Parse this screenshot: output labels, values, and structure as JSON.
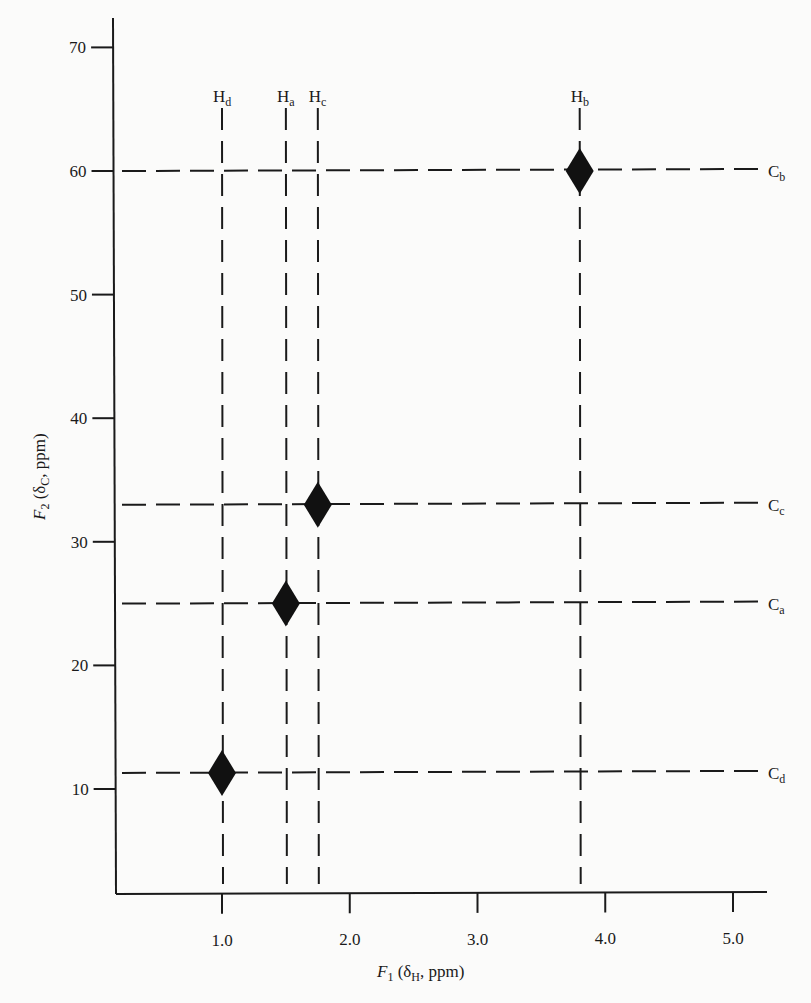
{
  "chart_data": {
    "type": "scatter",
    "title": "",
    "subtitle": "2D HETCOR correlation map",
    "xlabel": "F1 (δH, ppm)",
    "ylabel": "F2 (δC, ppm)",
    "xlabel_parts": {
      "main": "F",
      "sub": "1",
      "rest_open": " (δ",
      "rest_sub": "H",
      "rest_close": ", ppm)"
    },
    "ylabel_parts": {
      "main": "F",
      "sub": "2",
      "rest_open": " (δ",
      "rest_sub": "C",
      "rest_close": ", ppm)"
    },
    "xlim": [
      0.25,
      5.25
    ],
    "ylim": [
      3,
      73
    ],
    "x_ticks": [
      1.0,
      2.0,
      3.0,
      4.0,
      5.0
    ],
    "x_tick_labels": [
      "1.0",
      "2.0",
      "3.0",
      "4.0",
      "5.0"
    ],
    "y_ticks": [
      10,
      20,
      30,
      40,
      50,
      60,
      70
    ],
    "y_tick_labels": [
      "10",
      "20",
      "30",
      "40",
      "50",
      "60",
      "70"
    ],
    "grid": false,
    "legend": "none",
    "marker": "filled-diamond",
    "marker_color": "#111111",
    "guide_line_style": "dashed",
    "points": [
      {
        "h_label": "H",
        "h_sub": "d",
        "c_label": "C",
        "c_sub": "d",
        "x": 1.0,
        "y": 11.3
      },
      {
        "h_label": "H",
        "h_sub": "a",
        "c_label": "C",
        "c_sub": "a",
        "x": 1.5,
        "y": 25.0
      },
      {
        "h_label": "H",
        "h_sub": "c",
        "c_label": "C",
        "c_sub": "c",
        "x": 1.75,
        "y": 33.0
      },
      {
        "h_label": "H",
        "h_sub": "b",
        "c_label": "C",
        "c_sub": "b",
        "x": 3.8,
        "y": 60.0
      }
    ]
  },
  "colors": {
    "background": "#fbfbfa",
    "ink": "#1a1a1a"
  }
}
